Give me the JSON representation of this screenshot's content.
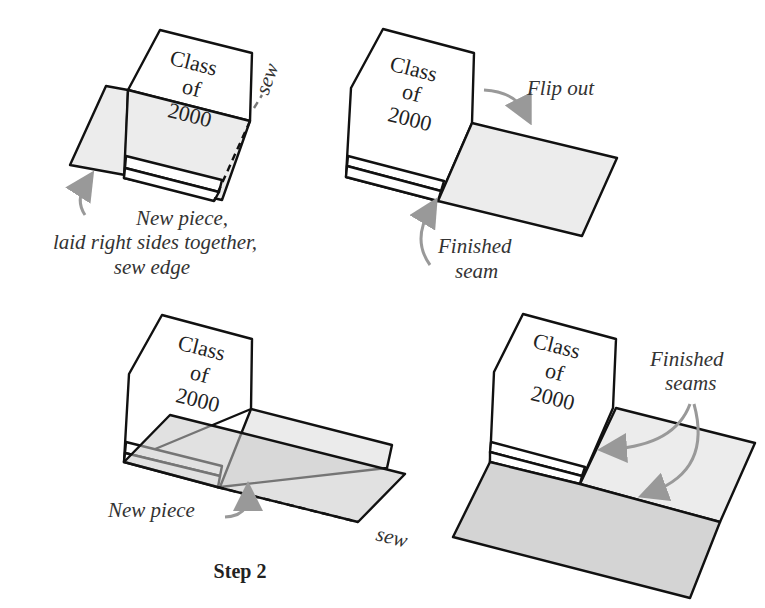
{
  "diagram": {
    "title": "Step 2",
    "block_text": [
      "Class",
      "of",
      "2000"
    ],
    "panels": [
      {
        "id": "panel-1",
        "labels": {
          "sew": "sew",
          "caption_lines": [
            "New piece,",
            "laid right sides together,",
            "sew edge"
          ]
        }
      },
      {
        "id": "panel-2",
        "labels": {
          "flip": "Flip out",
          "seam_lines": [
            "Finished",
            "seam"
          ]
        }
      },
      {
        "id": "panel-3",
        "labels": {
          "new_piece": "New piece",
          "sew": "sew"
        }
      },
      {
        "id": "panel-4",
        "labels": {
          "seams_lines": [
            "Finished",
            "seams"
          ]
        }
      }
    ],
    "colors": {
      "outline": "#111111",
      "fabric_light": "#ececec",
      "fabric_mid": "#d4d4d4",
      "arrow": "#999999"
    }
  }
}
